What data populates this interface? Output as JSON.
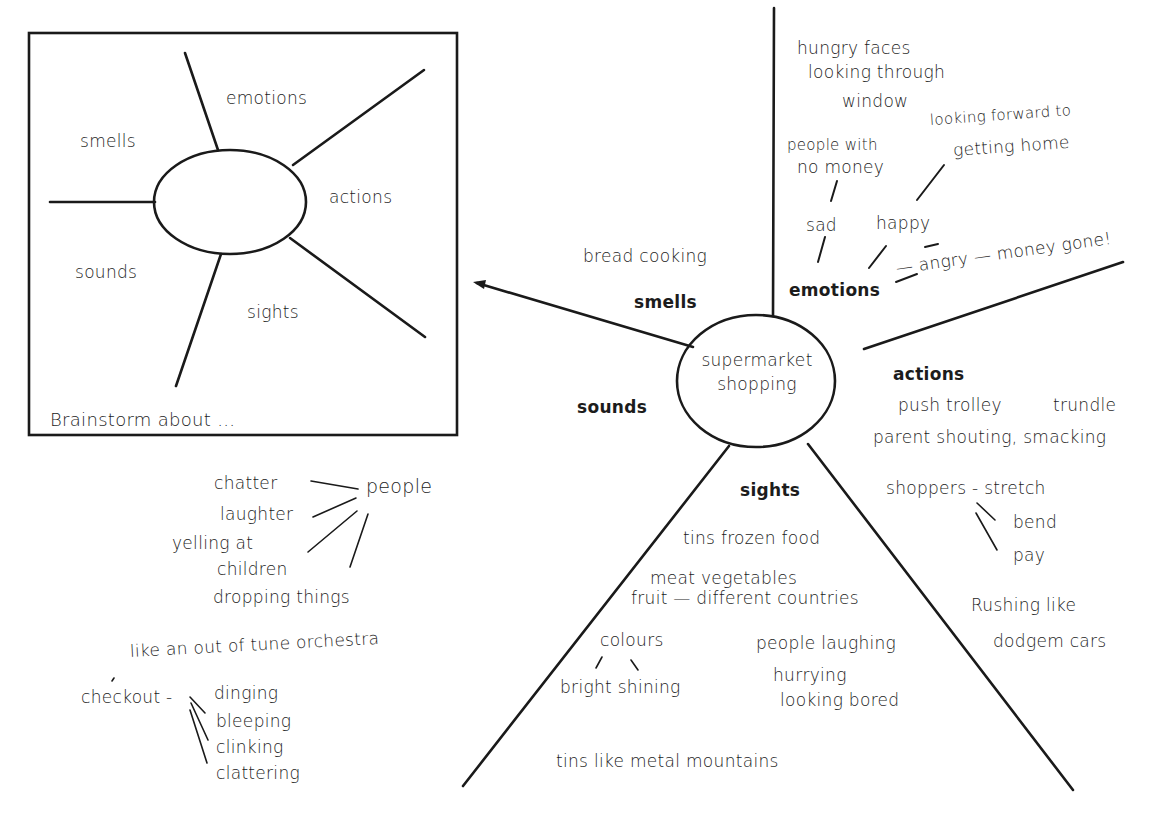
{
  "template_box": {
    "caption": "Brainstorm about ...",
    "branches": {
      "emotions": "emotions",
      "smells": "smells",
      "actions": "actions",
      "sounds": "sounds",
      "sights": "sights"
    }
  },
  "main_map": {
    "center": {
      "line1": "supermarket",
      "line2": "shopping"
    },
    "smells": {
      "label": "smells",
      "items": [
        "bread cooking"
      ]
    },
    "emotions": {
      "label": "emotions",
      "items": {
        "hungry1": "hungry faces",
        "hungry2": "looking through",
        "hungry3": "window",
        "nomoney1": "people with",
        "nomoney2": "no money",
        "forward1": "looking forward to",
        "forward2": "getting home",
        "sad": "sad",
        "happy": "happy",
        "angry": "— angry — money gone!"
      }
    },
    "actions": {
      "label": "actions",
      "items": {
        "push": "push trolley",
        "trundle": "trundle",
        "parent": "parent shouting, smacking",
        "shoppers": "shoppers -  stretch",
        "bend": "bend",
        "pay": "pay",
        "rush1": "Rushing like",
        "rush2": "dodgem cars"
      }
    },
    "sights": {
      "label": "sights",
      "items": {
        "tins": "tins   frozen food",
        "meat": "meat  vegetables",
        "fruit": "fruit — different countries",
        "colours": "colours",
        "bright": "bright  shining",
        "laughing": "people  laughing",
        "hurrying": "hurrying",
        "bored": "looking  bored",
        "mountains": "tins   like   metal   mountains"
      }
    },
    "sounds": {
      "label": "sounds",
      "items": {
        "chatter": "chatter",
        "people": "people",
        "laughter": "laughter",
        "yelling1": "yelling at",
        "yelling2": "children",
        "dropping": "dropping  things",
        "orchestra": "like an out of tune orchestra",
        "checkout": "checkout  -",
        "dinging": "dinging",
        "bleeping": "bleeping",
        "clinking": "clinking",
        "clattering": "clattering"
      }
    }
  }
}
